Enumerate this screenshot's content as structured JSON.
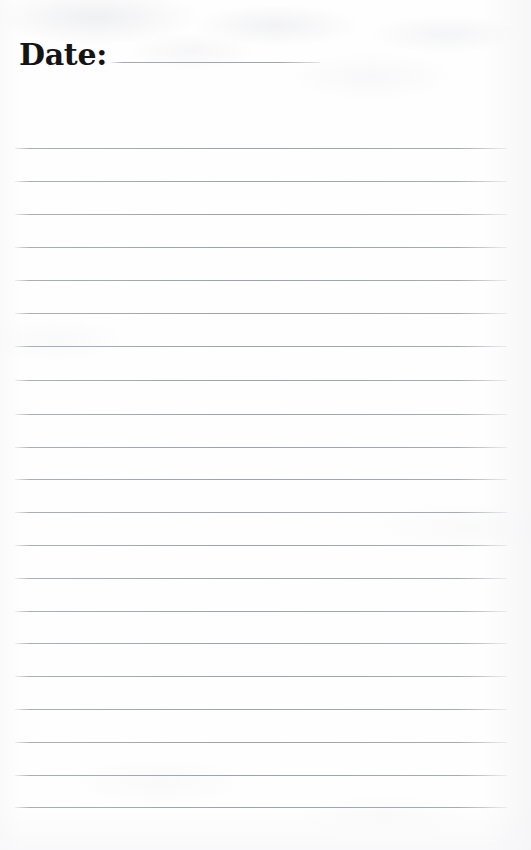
{
  "document": {
    "type": "lined-notepad-page",
    "width": 531,
    "height": 850,
    "background_color": "#fefefe"
  },
  "header": {
    "date_label": "Date:",
    "date_value": "",
    "date_rule": {
      "name": "date-fill-in-rule",
      "left": 91,
      "top": 62,
      "width": 210,
      "color": "#969aa2"
    }
  },
  "body": {
    "rule_color": "#a2a6b0",
    "rule_left": 15,
    "rule_width": 492,
    "first_rule_y": 148,
    "rule_spacing": 33,
    "rule_count": 21,
    "rules": [
      {
        "index": 1,
        "y": 148,
        "text": ""
      },
      {
        "index": 2,
        "y": 181,
        "text": ""
      },
      {
        "index": 3,
        "y": 214,
        "text": ""
      },
      {
        "index": 4,
        "y": 247,
        "text": ""
      },
      {
        "index": 5,
        "y": 280,
        "text": ""
      },
      {
        "index": 6,
        "y": 313,
        "text": ""
      },
      {
        "index": 7,
        "y": 346,
        "text": ""
      },
      {
        "index": 8,
        "y": 380,
        "text": ""
      },
      {
        "index": 9,
        "y": 414,
        "text": ""
      },
      {
        "index": 10,
        "y": 447,
        "text": ""
      },
      {
        "index": 11,
        "y": 479,
        "text": ""
      },
      {
        "index": 12,
        "y": 512,
        "text": ""
      },
      {
        "index": 13,
        "y": 545,
        "text": ""
      },
      {
        "index": 14,
        "y": 578,
        "text": ""
      },
      {
        "index": 15,
        "y": 611,
        "text": ""
      },
      {
        "index": 16,
        "y": 643,
        "text": ""
      },
      {
        "index": 17,
        "y": 676,
        "text": ""
      },
      {
        "index": 18,
        "y": 709,
        "text": ""
      },
      {
        "index": 19,
        "y": 742,
        "text": ""
      },
      {
        "index": 20,
        "y": 775,
        "text": ""
      },
      {
        "index": 21,
        "y": 807,
        "text": ""
      }
    ]
  }
}
